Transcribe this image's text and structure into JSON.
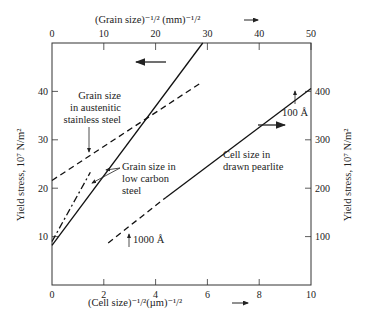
{
  "chart_data": {
    "type": "line",
    "title": "",
    "axes": {
      "x_bottom": {
        "label": "(Cell size)^-1/2 (µm)^-1/2",
        "range": [
          0,
          10
        ],
        "ticks": [
          0,
          2,
          4,
          6,
          8,
          10
        ]
      },
      "x_top": {
        "label": "(Grain size)^-1/2 (mm)^-1/2",
        "range": [
          0,
          50
        ],
        "ticks": [
          0,
          10,
          20,
          30,
          40,
          50
        ]
      },
      "y_left": {
        "label": "Yield stress, 10^7 N/m^2",
        "range": [
          0,
          50
        ],
        "ticks": [
          10,
          20,
          30,
          40
        ]
      },
      "y_right": {
        "label": "Yield stress, 10^7 N/m^2",
        "range": [
          0,
          500
        ],
        "ticks": [
          100,
          200,
          300,
          400
        ]
      }
    },
    "series": [
      {
        "name": "Grain size in low carbon steel (solid)",
        "axes": "x_top/y_left",
        "style": "solid",
        "points": [
          [
            0,
            8.2
          ],
          [
            29.1,
            50
          ]
        ]
      },
      {
        "name": "Grain size in low carbon steel (dash-dot)",
        "axes": "x_top/y_left",
        "style": "dashdot",
        "points": [
          [
            0,
            9
          ],
          [
            7.4,
            23.3
          ]
        ]
      },
      {
        "name": "Grain size in austenitic stainless steel",
        "axes": "x_top/y_left",
        "style": "dashed",
        "points": [
          [
            0,
            21.6
          ],
          [
            28.5,
            41.6
          ]
        ]
      },
      {
        "name": "Cell size in drawn pearlite (dashed portion)",
        "axes": "x_bottom/y_right",
        "style": "dashed",
        "points": [
          [
            2.17,
            87
          ],
          [
            4.4,
            181
          ]
        ]
      },
      {
        "name": "Cell size in drawn pearlite (solid portion)",
        "axes": "x_bottom/y_right",
        "style": "solid",
        "points": [
          [
            4.4,
            181
          ],
          [
            10,
            406
          ]
        ]
      }
    ],
    "annotations": [
      {
        "text": "Grain size in austenitic stainless steel",
        "lines": [
          "Grain size",
          "in austenitic",
          "stainless steel"
        ]
      },
      {
        "text": "Grain size in low carbon steel",
        "lines": [
          "Grain size in",
          "low carbon",
          "steel"
        ]
      },
      {
        "text": "Cell size in drawn pearlite",
        "lines": [
          "Cell size in",
          "drawn pearlite"
        ]
      },
      {
        "text": "100 Å",
        "marks": "pearlite point at x=10"
      },
      {
        "text": "1000 Å",
        "marks": "pearlite point near x=2.2"
      },
      {
        "text": "←",
        "meaning": "steep lines read on top axis"
      },
      {
        "text": "→",
        "meaning": "pearlite line read on right axis"
      }
    ],
    "grid": false,
    "legend": "none"
  }
}
